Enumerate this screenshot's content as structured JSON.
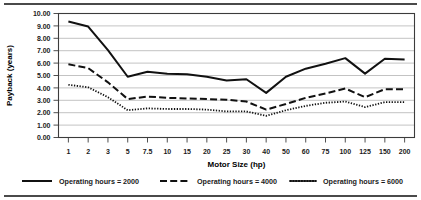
{
  "chart_data": {
    "type": "line",
    "title": "",
    "xlabel": "Motor Size (hp)",
    "ylabel": "Payback (years)",
    "categories": [
      "1",
      "2",
      "3",
      "5",
      "7.5",
      "10",
      "15",
      "20",
      "25",
      "30",
      "40",
      "50",
      "60",
      "75",
      "100",
      "125",
      "150",
      "200"
    ],
    "ylim": [
      0,
      10
    ],
    "ytick_step": 1,
    "ytick_labels": [
      "0.00",
      "1.00",
      "2.00",
      "3.00",
      "4.00",
      "5.00",
      "6.00",
      "7.00",
      "8.00",
      "9.00",
      "10.00"
    ],
    "grid": true,
    "legend_position": "bottom",
    "series": [
      {
        "name": "Operating hours = 2000",
        "style": "solid",
        "color": "#111111",
        "values": [
          9.35,
          8.95,
          7.05,
          4.9,
          5.3,
          5.15,
          5.1,
          4.9,
          4.6,
          4.7,
          3.6,
          4.9,
          5.55,
          5.95,
          6.4,
          5.15,
          6.35,
          6.3
        ]
      },
      {
        "name": "Operating hours = 4000",
        "style": "dashed",
        "color": "#111111",
        "values": [
          5.9,
          5.6,
          4.45,
          3.1,
          3.3,
          3.2,
          3.15,
          3.1,
          3.05,
          2.9,
          2.25,
          2.7,
          3.2,
          3.55,
          3.95,
          3.25,
          3.9,
          3.9
        ]
      },
      {
        "name": "Operating hours = 6000",
        "style": "dotted",
        "color": "#111111",
        "values": [
          4.25,
          4.05,
          3.25,
          2.2,
          2.35,
          2.3,
          2.3,
          2.25,
          2.1,
          2.1,
          1.75,
          2.2,
          2.55,
          2.8,
          2.9,
          2.45,
          2.85,
          2.85
        ]
      }
    ]
  },
  "legend": {
    "items": [
      {
        "label": "Operating hours = 2000",
        "style": "solid"
      },
      {
        "label": "Operating hours = 4000",
        "style": "dashed"
      },
      {
        "label": "Operating hours = 6000",
        "style": "dotted"
      }
    ]
  }
}
